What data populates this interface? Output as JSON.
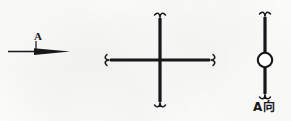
{
  "drawing": {
    "title": "Engineering section-view annotation",
    "background_color": "#fcfcfb",
    "ink_color": "#17171a",
    "figures": [
      {
        "id": "view-direction-arrow",
        "name": "view-direction-arrow",
        "label": "A",
        "description": "horizontal leader line terminating in a solid right-pointing arrowhead",
        "direction": "right"
      },
      {
        "id": "cross-section-lines",
        "name": "cross-section-lines",
        "label": "",
        "description": "orthogonal cross of two thick lines, each of the four ends closed by an S-shaped break-line terminator",
        "arms": 4
      },
      {
        "id": "view-a-symbol",
        "name": "view-a-symbol",
        "label": "A向",
        "description": "vertical thick line with a hollow circle at its midpoint, break-line terminators top and bottom",
        "circle": "hollow"
      }
    ]
  },
  "labels": {
    "arrow_label": "A",
    "view_label": "A向"
  },
  "colors": {
    "ink": "#17171a",
    "paper": "#fcfcfb",
    "circle_fill": "#ffffff"
  }
}
